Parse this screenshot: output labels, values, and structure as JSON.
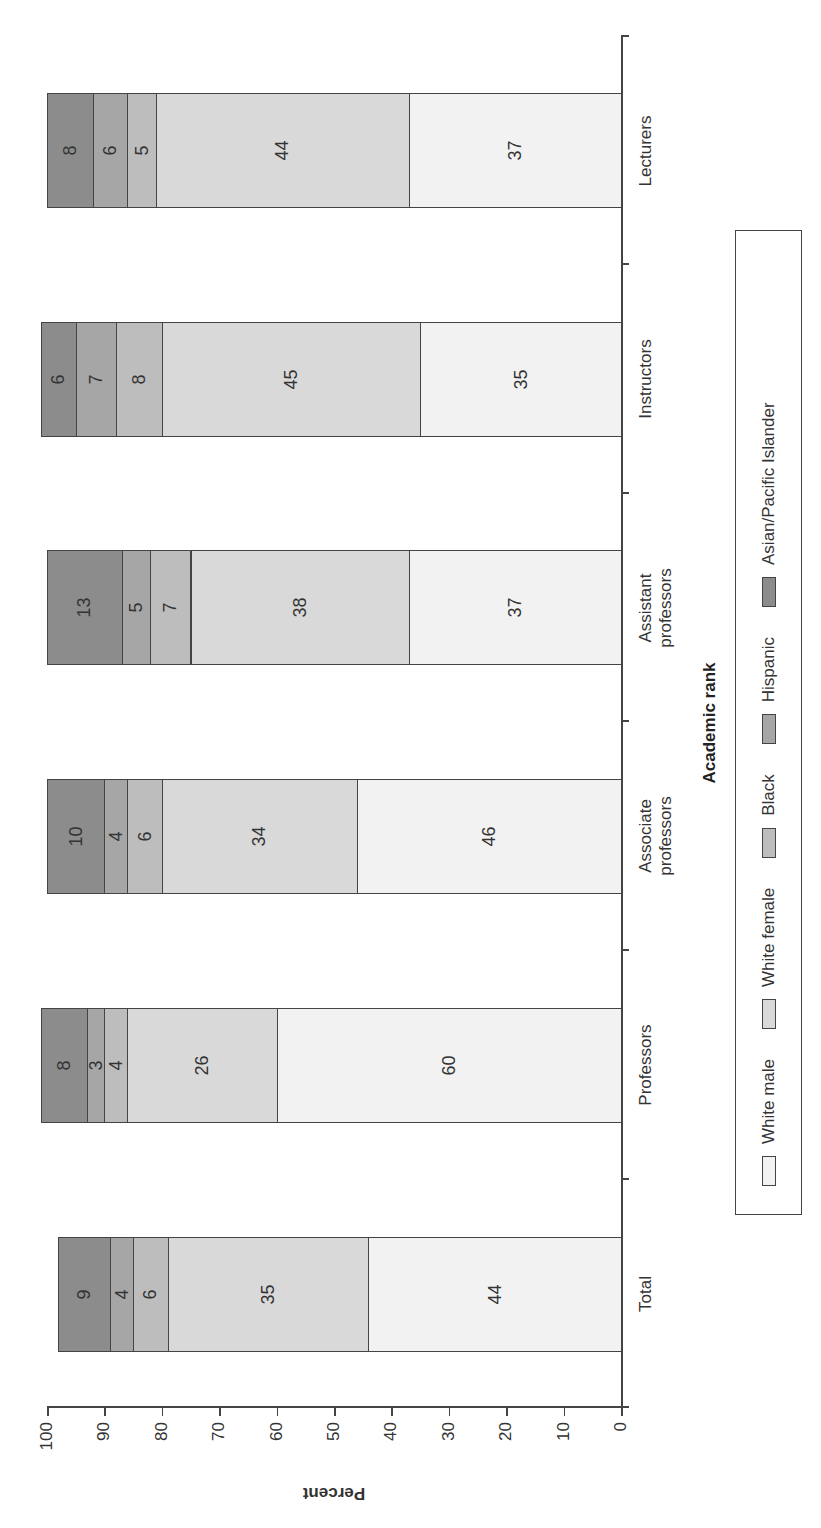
{
  "chart_data": {
    "type": "bar",
    "stacked": true,
    "orientation_note": "vertical stacked bars; whole figure rotated 90 degrees counterclockwise in the image",
    "title": "",
    "xlabel": "Academic rank",
    "ylabel": "Percent",
    "ylim": [
      0,
      100
    ],
    "yticks": [
      0,
      10,
      20,
      30,
      40,
      50,
      60,
      70,
      80,
      90,
      100
    ],
    "grid": false,
    "legend_position": "bottom",
    "categories": [
      "Total",
      "Professors",
      "Associate professors",
      "Assistant professors",
      "Instructors",
      "Lecturers"
    ],
    "series": [
      {
        "name": "White male",
        "color": "#f2f2f2",
        "values": [
          44,
          60,
          46,
          37,
          35,
          37
        ]
      },
      {
        "name": "White female",
        "color": "#d9d9d9",
        "values": [
          35,
          26,
          34,
          38,
          45,
          44
        ]
      },
      {
        "name": "Black",
        "color": "#bdbdbd",
        "values": [
          6,
          4,
          6,
          7,
          8,
          5
        ]
      },
      {
        "name": "Hispanic",
        "color": "#a6a6a6",
        "values": [
          4,
          3,
          4,
          5,
          7,
          6
        ]
      },
      {
        "name": "Asian/Pacific Islander",
        "color": "#8c8c8c",
        "values": [
          9,
          8,
          10,
          13,
          6,
          8
        ]
      }
    ]
  },
  "labels": {
    "ylabel": "Percent",
    "xlabel": "Academic rank",
    "yticks": [
      "100",
      "90",
      "80",
      "70",
      "60",
      "50",
      "40",
      "30",
      "20",
      "10",
      "0"
    ],
    "categories": [
      {
        "line1": "Total",
        "line2": ""
      },
      {
        "line1": "Professors",
        "line2": ""
      },
      {
        "line1": "Associate",
        "line2": "professors"
      },
      {
        "line1": "Assistant",
        "line2": "professors"
      },
      {
        "line1": "Instructors",
        "line2": ""
      },
      {
        "line1": "Lecturers",
        "line2": ""
      }
    ],
    "legend": [
      "White male",
      "White female",
      "Black",
      "Hispanic",
      "Asian/Pacific Islander"
    ]
  }
}
